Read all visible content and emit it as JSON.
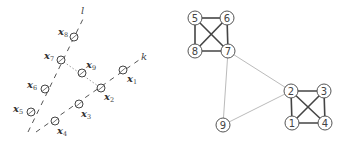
{
  "left_diagram": {
    "lines": [
      {
        "name": "l",
        "label": "l",
        "from": [
          28,
          132
        ],
        "to": [
          83,
          19
        ],
        "label_pos": [
          81,
          14
        ],
        "style": "dashed"
      },
      {
        "name": "k",
        "label": "k",
        "from": [
          36,
          132
        ],
        "to": [
          139,
          60
        ],
        "label_pos": [
          141,
          60
        ],
        "style": "dashed"
      }
    ],
    "connector": {
      "from": [
        61,
        60
      ],
      "to": [
        101,
        88
      ],
      "style": "dotted"
    },
    "points": [
      {
        "id": "x1",
        "label": "x",
        "sub": "1",
        "cx": 123,
        "cy": 70,
        "lx": 127,
        "ly": 82
      },
      {
        "id": "x2",
        "label": "x",
        "sub": "2",
        "cx": 101,
        "cy": 88,
        "lx": 104,
        "ly": 100
      },
      {
        "id": "x3",
        "label": "x",
        "sub": "3",
        "cx": 79,
        "cy": 104,
        "lx": 81,
        "ly": 117
      },
      {
        "id": "x4",
        "label": "x",
        "sub": "4",
        "cx": 55,
        "cy": 121,
        "lx": 57,
        "ly": 134
      },
      {
        "id": "x5",
        "label": "x",
        "sub": "5",
        "cx": 31,
        "cy": 112,
        "lx": 13,
        "ly": 112
      },
      {
        "id": "x6",
        "label": "x",
        "sub": "6",
        "cx": 45,
        "cy": 89,
        "lx": 27,
        "ly": 88
      },
      {
        "id": "x7",
        "label": "x",
        "sub": "7",
        "cx": 61,
        "cy": 60,
        "lx": 44,
        "ly": 59
      },
      {
        "id": "x8",
        "label": "x",
        "sub": "8",
        "cx": 74,
        "cy": 37,
        "lx": 58,
        "ly": 35
      },
      {
        "id": "x9",
        "label": "x",
        "sub": "9",
        "cx": 82,
        "cy": 73,
        "lx": 86,
        "ly": 68
      }
    ]
  },
  "right_graph": {
    "nodes": [
      {
        "id": "1",
        "label": "1",
        "cx": 292,
        "cy": 123
      },
      {
        "id": "2",
        "label": "2",
        "cx": 291,
        "cy": 91
      },
      {
        "id": "3",
        "label": "3",
        "cx": 324,
        "cy": 91
      },
      {
        "id": "4",
        "label": "4",
        "cx": 325,
        "cy": 123
      },
      {
        "id": "5",
        "label": "5",
        "cx": 195,
        "cy": 18
      },
      {
        "id": "6",
        "label": "6",
        "cx": 227,
        "cy": 18
      },
      {
        "id": "7",
        "label": "7",
        "cx": 228,
        "cy": 51
      },
      {
        "id": "8",
        "label": "8",
        "cx": 195,
        "cy": 51
      },
      {
        "id": "9",
        "label": "9",
        "cx": 223,
        "cy": 125
      }
    ],
    "strong_edges": [
      [
        "5",
        "6"
      ],
      [
        "5",
        "8"
      ],
      [
        "5",
        "7"
      ],
      [
        "6",
        "8"
      ],
      [
        "6",
        "7"
      ],
      [
        "8",
        "7"
      ],
      [
        "2",
        "3"
      ],
      [
        "2",
        "1"
      ],
      [
        "2",
        "4"
      ],
      [
        "3",
        "1"
      ],
      [
        "3",
        "4"
      ],
      [
        "1",
        "4"
      ]
    ],
    "weak_edges": [
      [
        "7",
        "2"
      ],
      [
        "7",
        "9"
      ],
      [
        "9",
        "2"
      ]
    ]
  }
}
